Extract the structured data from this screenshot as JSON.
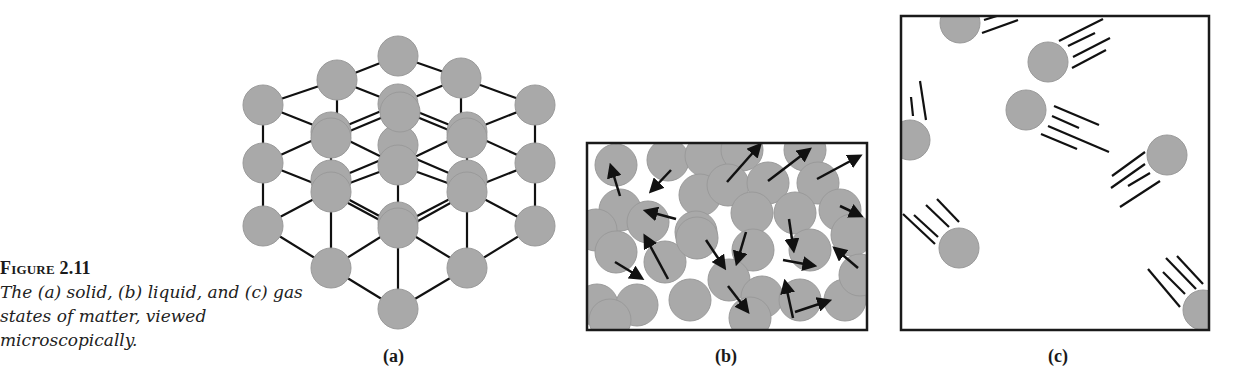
{
  "caption": {
    "label": "Figure 2.11",
    "text": "The (a) solid, (b) liquid, and (c) gas states of matter, viewed microscopically."
  },
  "panels": [
    {
      "id": "a",
      "label": "(a)",
      "state": "solid"
    },
    {
      "id": "b",
      "label": "(b)",
      "state": "liquid"
    },
    {
      "id": "c",
      "label": "(c)",
      "state": "gas"
    }
  ],
  "colors": {
    "particle_fill": "#a9a9a9",
    "particle_stroke": "#9a9a9a",
    "line": "#111111",
    "frame": "#1a1a1a"
  }
}
